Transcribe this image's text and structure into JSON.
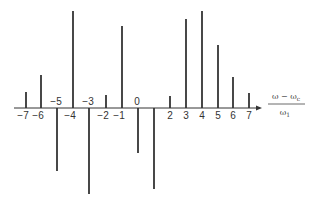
{
  "chart_data": {
    "type": "bar",
    "subtype": "stem",
    "title": "",
    "xlabel": "(ω − ω_c) / ω_1",
    "xlabel_parts": {
      "numerator": "ω − ω",
      "numerator_sub": "c",
      "denominator": "ω",
      "denominator_sub": "1"
    },
    "ylabel": "",
    "categories": [
      -7,
      -6,
      -5,
      -4,
      -3,
      -2,
      -1,
      0,
      1,
      2,
      3,
      4,
      5,
      6,
      7
    ],
    "tick_labels": [
      "−7",
      "−6",
      "−5",
      "−4",
      "−3",
      "−2",
      "−1",
      "0",
      "",
      "2",
      "3",
      "4",
      "5",
      "6",
      "7"
    ],
    "values": [
      16,
      33,
      -63,
      97,
      -86,
      13,
      82,
      -45,
      -81,
      12,
      89,
      97,
      63,
      31,
      15
    ],
    "value_units": "relative amplitude (px-estimated)",
    "ylim": [
      -100,
      100
    ],
    "grid": false,
    "legend": null,
    "axis_arrow": true,
    "colors": {
      "stem": "#1a1a1a",
      "axis": "#333333",
      "text": "#333333"
    }
  },
  "layout": {
    "axis_y": 108,
    "axis_x_start": 14,
    "axis_x_end": 262,
    "x_positions": [
      26,
      41,
      57,
      73,
      89,
      106,
      122,
      138,
      154,
      170,
      186,
      202,
      218,
      233,
      249
    ],
    "px_per_unit": 1.0
  }
}
